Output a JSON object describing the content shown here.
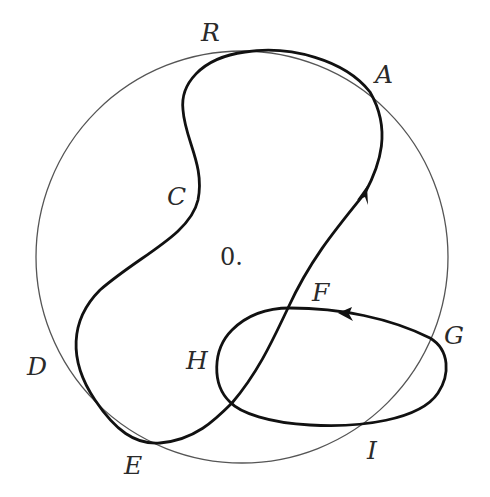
{
  "diagram": {
    "origin_label": "0.",
    "points": [
      {
        "id": "R",
        "label": "R"
      },
      {
        "id": "A",
        "label": "A"
      },
      {
        "id": "C",
        "label": "C"
      },
      {
        "id": "D",
        "label": "D"
      },
      {
        "id": "E",
        "label": "E"
      },
      {
        "id": "F",
        "label": "F"
      },
      {
        "id": "G",
        "label": "G"
      },
      {
        "id": "H",
        "label": "H"
      },
      {
        "id": "I",
        "label": "I"
      }
    ],
    "arrows": [
      {
        "id": "arrow-upward",
        "direction": "up-right"
      },
      {
        "id": "arrow-loop",
        "direction": "left"
      }
    ],
    "colors": {
      "circle": "#555555",
      "curve": "#111111",
      "text": "#2a2a2a",
      "background": "#ffffff"
    }
  }
}
